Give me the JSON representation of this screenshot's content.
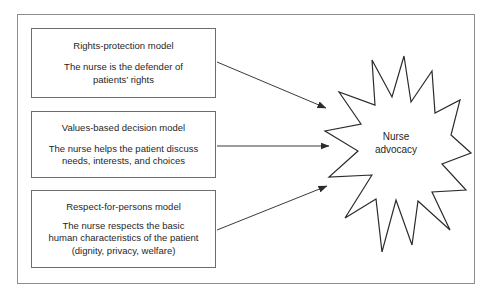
{
  "diagram": {
    "boxes": [
      {
        "id": "rights-protection",
        "title": "Rights-protection model",
        "description_lines": [
          "The nurse is the defender of",
          "patients’ rights"
        ]
      },
      {
        "id": "values-based",
        "title": "Values-based decision model",
        "description_lines": [
          "The nurse helps the patient discuss",
          "needs, interests, and choices"
        ]
      },
      {
        "id": "respect-persons",
        "title": "Respect-for-persons model",
        "description_lines": [
          "The nurse respects the basic",
          "human characteristics of the patient",
          "(dignity, privacy, welfare)"
        ]
      }
    ],
    "target": {
      "id": "nurse-advocacy",
      "shape": "starburst",
      "label_lines": [
        "Nurse",
        "advocacy"
      ]
    },
    "arrows": [
      {
        "id": "arrow-rights-to-advocacy",
        "from": "rights-protection",
        "to": "nurse-advocacy",
        "direction": "down-right"
      },
      {
        "id": "arrow-values-to-advocacy",
        "from": "values-based",
        "to": "nurse-advocacy",
        "direction": "right"
      },
      {
        "id": "arrow-respect-to-advocacy",
        "from": "respect-persons",
        "to": "nurse-advocacy",
        "direction": "up-right"
      }
    ],
    "colors": {
      "frame_border": "#8d8d8d",
      "box_border": "#6d6d6d",
      "line": "#3a3a3a",
      "text": "#1f1f1f",
      "background": "#ffffff"
    }
  }
}
